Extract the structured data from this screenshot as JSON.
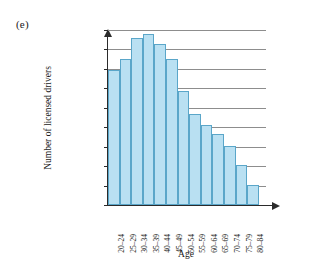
{
  "panel_label": "(e)",
  "chart_data": {
    "type": "bar",
    "title": "",
    "xlabel": "Age",
    "ylabel": "Number of licensed drivers",
    "categories": [
      "20–24",
      "25–29",
      "30–34",
      "35–39",
      "40–44",
      "45–49",
      "50–54",
      "55–59",
      "60–64",
      "65–69",
      "70–74",
      "75–79",
      "80–84"
    ],
    "values": [
      348000,
      375000,
      430000,
      440000,
      415000,
      375000,
      293000,
      233000,
      205000,
      182000,
      152000,
      102000,
      52000
    ],
    "ylim": [
      0,
      450000
    ],
    "ytick_values": [
      0,
      50000,
      100000,
      150000,
      200000,
      250000,
      300000,
      350000,
      400000,
      450000
    ],
    "ytick_labels": [
      "0",
      "50,000",
      "100,000",
      "150,000",
      "200,000",
      "250,000",
      "300,000",
      "350,000",
      "400,000",
      "450,000"
    ],
    "grid": true,
    "legend": "none",
    "bar_fill_color": "#b9e0f2",
    "bar_edge_color": "#5aa6c9",
    "axis_color": "#2b2b2b",
    "grid_color": "#8d8d8d"
  }
}
